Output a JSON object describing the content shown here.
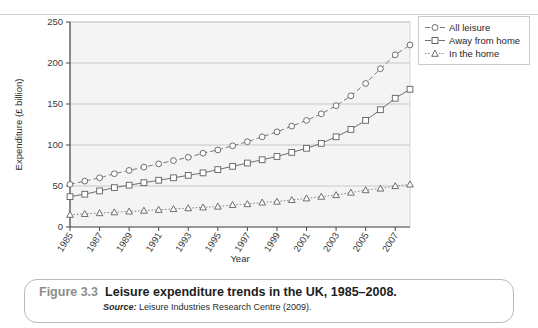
{
  "chart_data": {
    "type": "line",
    "title": "",
    "xlabel": "Year",
    "ylabel": "Expenditure (£ billion)",
    "xlim": [
      1985,
      2008
    ],
    "ylim": [
      0,
      250
    ],
    "yticks": [
      0,
      50,
      100,
      150,
      200,
      250
    ],
    "xticks": [
      1985,
      1987,
      1989,
      1991,
      1993,
      1995,
      1997,
      1999,
      2001,
      2003,
      2005,
      2007
    ],
    "xtick_labels": [
      "1985",
      "1987",
      "1989",
      "1991",
      "1993",
      "1995",
      "1997",
      "1999",
      "2001",
      "2003",
      "2005",
      "2007"
    ],
    "ytick_labels": [
      "0",
      "50",
      "100",
      "150",
      "200",
      "250"
    ],
    "grid": "horizontal",
    "legend_position": "outside-top-right",
    "x": [
      1985,
      1986,
      1987,
      1988,
      1989,
      1990,
      1991,
      1992,
      1993,
      1994,
      1995,
      1996,
      1997,
      1998,
      1999,
      2000,
      2001,
      2002,
      2003,
      2004,
      2005,
      2006,
      2007,
      2008
    ],
    "series": [
      {
        "name": "All leisure",
        "marker": "circle",
        "linestyle": "dashed",
        "color": "#7a7a7a",
        "values": [
          52,
          56,
          60,
          65,
          69,
          73,
          77,
          81,
          85,
          90,
          94,
          99,
          104,
          110,
          116,
          123,
          130,
          138,
          148,
          160,
          175,
          193,
          210,
          222
        ]
      },
      {
        "name": "Away from home",
        "marker": "square",
        "linestyle": "solid",
        "color": "#6f6f6f",
        "values": [
          37,
          40,
          44,
          48,
          51,
          54,
          57,
          60,
          63,
          66,
          70,
          74,
          78,
          82,
          86,
          91,
          96,
          102,
          110,
          119,
          130,
          143,
          157,
          168
        ]
      },
      {
        "name": "In the home",
        "marker": "triangle",
        "linestyle": "dotted",
        "color": "#8a8a8a",
        "values": [
          15,
          16,
          17,
          18,
          19,
          20,
          21,
          22,
          23,
          24,
          25,
          27,
          28,
          30,
          31,
          33,
          35,
          37,
          39,
          42,
          45,
          47,
          50,
          52
        ]
      }
    ]
  },
  "legend": {
    "items": [
      {
        "label": "All leisure",
        "marker": "circle"
      },
      {
        "label": "Away from home",
        "marker": "square"
      },
      {
        "label": "In the home",
        "marker": "triangle"
      }
    ]
  },
  "caption": {
    "figure_number": "Figure 3.3",
    "title": "Leisure expenditure trends in the UK, 1985–2008.",
    "source_label": "Source:",
    "source_text": "Leisure Industries Research Centre (2009)."
  },
  "colors": {
    "plot_background": "#f4f4f4",
    "gridline": "#c8c8c8",
    "axis": "#4a4a4a",
    "caption_border": "#b9b9b9",
    "figure_number": "#8d8d8d"
  }
}
